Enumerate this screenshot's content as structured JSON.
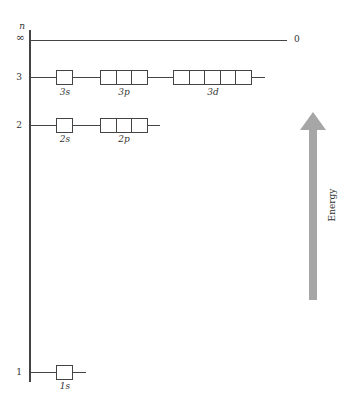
{
  "diagram": {
    "axis_label": "n",
    "infinity_label": "∞",
    "zero_label": "0",
    "energy_label": "Energy",
    "arrow_color": "#a6a6a6",
    "levels": [
      {
        "n": "3",
        "orbitals": [
          {
            "label": "3s",
            "boxes": 1
          },
          {
            "label": "3p",
            "boxes": 3
          },
          {
            "label": "3d",
            "boxes": 5
          }
        ]
      },
      {
        "n": "2",
        "orbitals": [
          {
            "label": "2s",
            "boxes": 1
          },
          {
            "label": "2p",
            "boxes": 3
          }
        ]
      },
      {
        "n": "1",
        "orbitals": [
          {
            "label": "1s",
            "boxes": 1
          }
        ]
      }
    ]
  }
}
